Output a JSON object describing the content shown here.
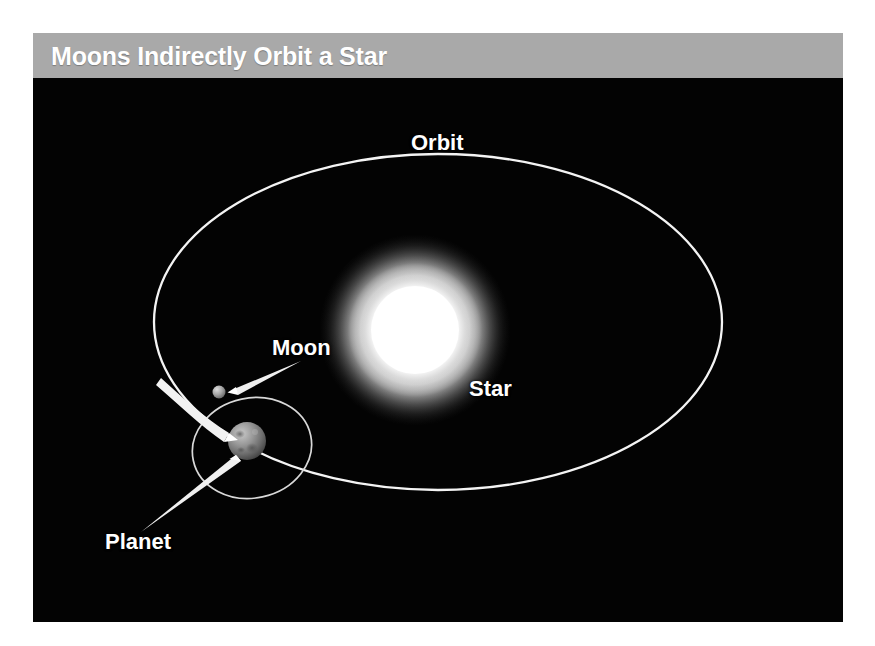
{
  "figure": {
    "title": "Moons Indirectly Orbit a Star",
    "background_color": "#030303",
    "header_color": "#a9a9a9",
    "title_color": "#ffffff",
    "line_color": "#f2f2f2"
  },
  "labels": {
    "orbit": "Orbit",
    "star": "Star",
    "moon": "Moon",
    "planet": "Planet"
  },
  "diagram_data": {
    "type": "astronomy-diagram",
    "subject": "Moons Indirectly Orbit a Star",
    "bodies": [
      {
        "name": "Star",
        "kind": "star",
        "color": "#ffffff",
        "center": [
          382,
          252
        ],
        "radius": 62,
        "glow_radius": 96,
        "description": "Bright glowing white star at the focus of the planetary orbit"
      },
      {
        "name": "Planet",
        "kind": "planet",
        "color": "#8c8c8c",
        "center": [
          214,
          363
        ],
        "radius": 19,
        "description": "Gray cratered sphere travelling along the stellar orbit"
      },
      {
        "name": "Moon",
        "kind": "moon",
        "color": "#a0a0a0",
        "center": [
          186,
          314
        ],
        "radius": 6.5,
        "description": "Small gray sphere orbiting the planet"
      }
    ],
    "orbits": [
      {
        "name": "Orbit",
        "of": "Planet",
        "around": "Star",
        "shape": "ellipse",
        "center": [
          405,
          244
        ],
        "rx": 284,
        "ry": 168,
        "stroke": "#f2f2f2",
        "stroke_width": 2.2
      },
      {
        "name": "Moon orbit",
        "of": "Moon",
        "around": "Planet",
        "shape": "ellipse",
        "center": [
          219,
          370
        ],
        "rx": 60,
        "ry": 50,
        "rotation_deg": -12,
        "stroke": "#dcdcdc",
        "stroke_width": 1.6
      }
    ],
    "annotations": [
      {
        "label": "Orbit",
        "target": "Orbit ellipse",
        "pointer": "none"
      },
      {
        "label": "Star",
        "target": "Star",
        "pointer": "none"
      },
      {
        "label": "Moon",
        "target": "Moon",
        "pointer": "tapered-arrow",
        "from": [
          268,
          283
        ],
        "to": [
          194,
          314
        ]
      },
      {
        "label": "Planet",
        "target": "Planet",
        "pointer": "tapered-arrow",
        "from": [
          110,
          452
        ],
        "to": [
          208,
          372
        ]
      }
    ]
  }
}
